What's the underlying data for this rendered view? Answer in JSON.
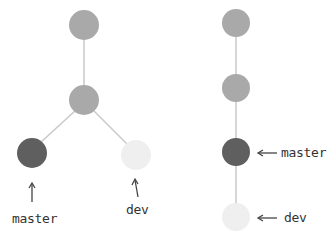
{
  "left_diagram": {
    "title": "branching",
    "labels": {
      "master": "master",
      "dev": "dev"
    },
    "nodes": [
      {
        "id": "c1",
        "color": "#a9a9a9"
      },
      {
        "id": "c2",
        "color": "#a9a9a9"
      },
      {
        "id": "master",
        "color": "#5f5f5f"
      },
      {
        "id": "dev",
        "color": "#efefef"
      }
    ]
  },
  "right_diagram": {
    "title": "linear",
    "labels": {
      "master": "master",
      "dev": "dev"
    },
    "nodes": [
      {
        "id": "c1",
        "color": "#a9a9a9"
      },
      {
        "id": "c2",
        "color": "#a9a9a9"
      },
      {
        "id": "master",
        "color": "#5f5f5f"
      },
      {
        "id": "dev",
        "color": "#efefef"
      }
    ]
  },
  "colors": {
    "line": "#c8c8c8",
    "arrow": "#444444",
    "text": "#333333"
  }
}
